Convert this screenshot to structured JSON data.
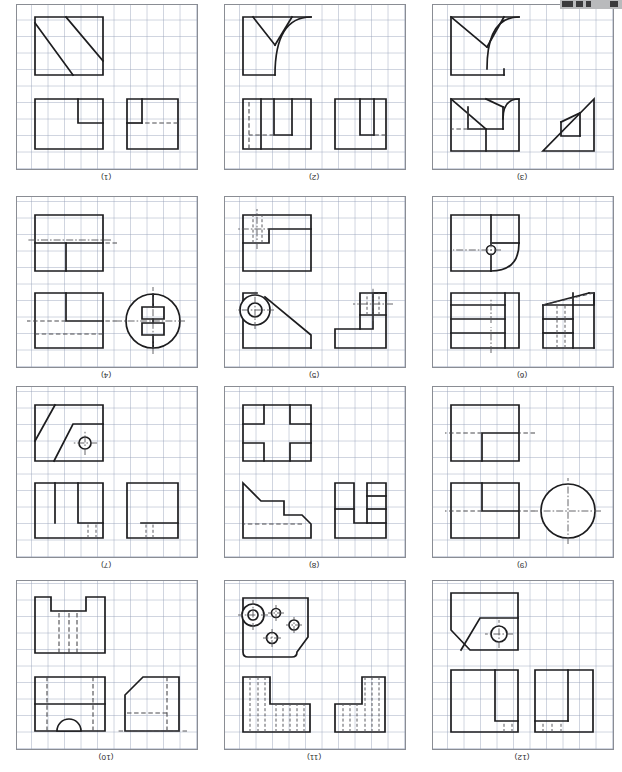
{
  "document": {
    "kind": "orthographic-projection-exercise-sheet",
    "orientation_note": "page scanned upside down",
    "panel_count": 12,
    "columns": 3,
    "rows": 4
  },
  "panels": [
    {
      "id": "panel-12",
      "label": "(12)",
      "col": 0,
      "row": 0,
      "views": [
        "front",
        "side",
        "isometric"
      ],
      "features": [
        "rectangular block with central slot",
        "hidden slot lines",
        "chamfered corner",
        "through hole with centerlines"
      ]
    },
    {
      "id": "panel-11",
      "label": "(11)",
      "col": 1,
      "row": 0,
      "views": [
        "front",
        "side",
        "plan"
      ],
      "features": [
        "L-shaped stepped block",
        "dense hidden-line hatching",
        "rounded corner plate",
        "four holes of varying diameter",
        "counterbored hole"
      ]
    },
    {
      "id": "panel-10",
      "label": "(10)",
      "col": 2,
      "row": 0,
      "views": [
        "side",
        "front",
        "plan"
      ],
      "features": [
        "chamfered corner",
        "semicircular notch",
        "hidden lines",
        "rectangular bottom notch"
      ]
    },
    {
      "id": "panel-9",
      "label": "(9)",
      "col": 0,
      "row": 1,
      "views": [
        "end",
        "front",
        "plan"
      ],
      "features": [
        "full circle with centerlines",
        "stepped rectangular blocks",
        "hidden centerline"
      ]
    },
    {
      "id": "panel-8",
      "label": "(8)",
      "col": 1,
      "row": 1,
      "views": [
        "front",
        "side",
        "plan"
      ],
      "features": [
        "U-shaped stepped profile",
        "double chamfer",
        "cross / plus shaped plan"
      ]
    },
    {
      "id": "panel-7",
      "label": "(7)",
      "col": 2,
      "row": 1,
      "views": [
        "front",
        "side",
        "isometric"
      ],
      "features": [
        "narrow slot with hidden lines",
        "twin vertical ribs",
        "inclined faces",
        "hole with centerlines"
      ]
    },
    {
      "id": "panel-6",
      "label": "(6)",
      "col": 0,
      "row": 2,
      "views": [
        "front",
        "side",
        "isometric"
      ],
      "features": [
        "stepped horizontal ribs",
        "hidden slot lines",
        "filleted corner",
        "small hole with centerlines"
      ]
    },
    {
      "id": "panel-5",
      "label": "(5)",
      "col": 1,
      "row": 2,
      "views": [
        "front",
        "side",
        "plan"
      ],
      "features": [
        "L-bracket profile",
        "tapered arm",
        "boss with concentric circles",
        "rectangular pocket with hidden lines"
      ]
    },
    {
      "id": "panel-4",
      "label": "(4)",
      "col": 2,
      "row": 2,
      "views": [
        "end",
        "front",
        "plan"
      ],
      "features": [
        "circular disc with keyway slot",
        "horizontal centerline",
        "stepped rectangular views",
        "hidden lines"
      ]
    },
    {
      "id": "panel-3",
      "label": "(3)",
      "col": 0,
      "row": 3,
      "views": [
        "front",
        "side",
        "plan"
      ],
      "features": [
        "triangular gusset",
        "small rectangular tab",
        "concave fillet curves",
        "hidden rectangle"
      ]
    },
    {
      "id": "panel-2",
      "label": "(2)",
      "col": 1,
      "row": 3,
      "views": [
        "front",
        "side",
        "plan"
      ],
      "features": [
        "rectangular block with central rib",
        "hidden lines",
        "curved fillet transition"
      ]
    },
    {
      "id": "panel-1",
      "label": "(1)",
      "col": 2,
      "row": 3,
      "views": [
        "front",
        "side",
        "plan"
      ],
      "features": [
        "rectangular block with corner notch",
        "hidden edge line",
        "two parallel diagonal ribs"
      ]
    }
  ],
  "colors": {
    "grid_line": "#96a0b9",
    "visible_line": "#1d1d1f",
    "hidden_line": "#4a4a4e",
    "center_line": "#55555a",
    "panel_border": "#8a8d94",
    "paper": "#ffffff"
  }
}
